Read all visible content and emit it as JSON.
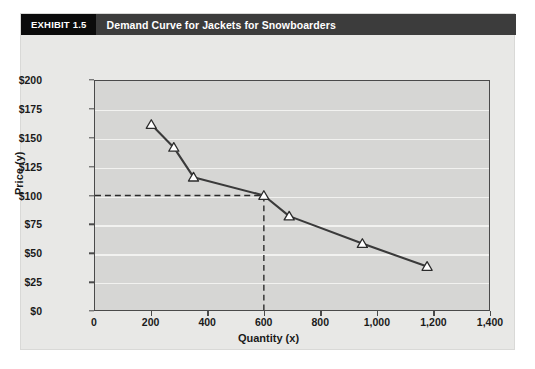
{
  "exhibit": {
    "badge": "EXHIBIT 1.5",
    "title": "Demand Curve for Jackets for Snowboarders"
  },
  "colors": {
    "badge_bg": "#0b0b0b",
    "header_bg": "#3c3c3c",
    "panel_bg": "#e8e8e6",
    "plot_bg": "#d6d6d4",
    "gridline": "#f2f2f0",
    "axis": "#4a4a4a",
    "series_line": "#3a3a3a",
    "marker_fill": "#ffffff",
    "marker_stroke": "#2b2b2b",
    "reference_line": "#2b2b2b"
  },
  "chart_data": {
    "type": "line",
    "title": "Demand Curve for Jackets for Snowboarders",
    "xlabel": "Quantity (x)",
    "ylabel": "Price (y)",
    "xlim": [
      0,
      1400
    ],
    "ylim": [
      0,
      200
    ],
    "xticks": [
      0,
      200,
      400,
      600,
      800,
      1000,
      1200,
      1400
    ],
    "xtick_labels": [
      "0",
      "200",
      "400",
      "600",
      "800",
      "1,000",
      "1,200",
      "1,400"
    ],
    "yticks": [
      0,
      25,
      50,
      75,
      100,
      125,
      150,
      175,
      200
    ],
    "ytick_labels": [
      "$0",
      "$25",
      "$50",
      "$75",
      "$100",
      "$125",
      "$150",
      "$175",
      "$200"
    ],
    "grid": "horizontal",
    "legend": "none",
    "marker": "triangle-up",
    "series": [
      {
        "name": "Demand Curve",
        "x": [
          200,
          280,
          350,
          600,
          690,
          950,
          1180
        ],
        "y": [
          162,
          142,
          116,
          100,
          82,
          58,
          38
        ]
      }
    ],
    "annotations": [
      {
        "type": "reference-lines",
        "style": "dashed",
        "x": 600,
        "y": 100,
        "description": "Dashed lines from y-axis at $100 to the curve and down to x = 600"
      }
    ]
  }
}
